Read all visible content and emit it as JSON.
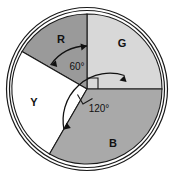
{
  "figure": {
    "name": "pie-circle-angle-diagram",
    "background": "#ffffff",
    "outer_ring": {
      "stroke": "#1a1a1a",
      "description": "double circular outline ring"
    },
    "circle": {
      "cx": 87,
      "cy": 89,
      "r": 75,
      "stroke": "#1a1a1a"
    }
  },
  "sectors": [
    {
      "id": "G",
      "label": "G",
      "angle_deg": 90,
      "start_deg": 0,
      "end_deg": 90,
      "fill": "#d8d8d8",
      "label_x": 122,
      "label_y": 47
    },
    {
      "id": "R",
      "label": "R",
      "angle_deg": 60,
      "start_deg": 90,
      "end_deg": 150,
      "fill": "#9a9a9a",
      "label_x": 61,
      "label_y": 43
    },
    {
      "id": "Y",
      "label": "Y",
      "angle_deg": 90,
      "start_deg": 150,
      "end_deg": 240,
      "fill": "#ffffff",
      "label_x": 34,
      "label_y": 106
    },
    {
      "id": "B",
      "label": "B",
      "angle_deg": 120,
      "start_deg": 240,
      "end_deg": 360,
      "fill": "#a9a9a9",
      "label_x": 113,
      "label_y": 147
    }
  ],
  "angle_annotations": [
    {
      "id": "angle-60",
      "text": "60°",
      "value": 60,
      "x": 77,
      "y": 70,
      "arrow": "double-headed arc between R boundaries"
    },
    {
      "id": "angle-120",
      "text": "120°",
      "value": 120,
      "x": 99,
      "y": 111,
      "arrow": "double-headed arc between B boundaries"
    }
  ],
  "right_angle_markers": [
    {
      "id": "right-angle-g",
      "x": 87,
      "y": 89,
      "rotation": 0
    },
    {
      "id": "right-angle-y",
      "x": 87,
      "y": 89,
      "rotation": 150
    }
  ]
}
